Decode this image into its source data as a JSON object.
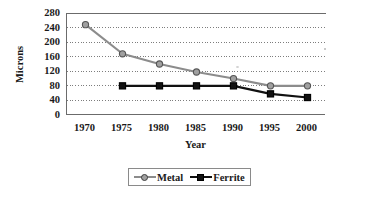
{
  "chart_data": {
    "type": "line",
    "title": "",
    "xlabel": "Year",
    "ylabel": "Microns",
    "categories": [
      1970,
      1975,
      1980,
      1985,
      1990,
      1995,
      2000
    ],
    "x_tick_labels": [
      "1970",
      "1975",
      "1980",
      "1985",
      "1990",
      "1995",
      "2000"
    ],
    "y_tick_labels": [
      "280",
      "240",
      "200",
      "160",
      "120",
      "80",
      "40",
      "0"
    ],
    "y_ticks": [
      280,
      240,
      200,
      160,
      120,
      80,
      40,
      0
    ],
    "ylim": [
      0,
      280
    ],
    "xlim": [
      1967.5,
      2002.5
    ],
    "grid": "horizontal-dotted",
    "legend_position": "bottom-center",
    "series": [
      {
        "name": "Metal",
        "marker": "circle",
        "color": "#8c8c8c",
        "marker_color": "#a0a0a0",
        "values": [
          248,
          168,
          140,
          118,
          100,
          80,
          80
        ]
      },
      {
        "name": "Ferrite",
        "marker": "square",
        "color": "#111111",
        "marker_color": "#111111",
        "values": [
          null,
          80,
          80,
          80,
          80,
          58,
          48
        ]
      }
    ]
  },
  "axes": {
    "y_title": "Microns",
    "x_title": "Year"
  },
  "legend": {
    "entries": [
      {
        "label": "Metal",
        "marker": "circle-marker-icon",
        "color": "#8c8c8c"
      },
      {
        "label": "Ferrite",
        "marker": "square-marker-icon",
        "color": "#111111"
      }
    ]
  }
}
